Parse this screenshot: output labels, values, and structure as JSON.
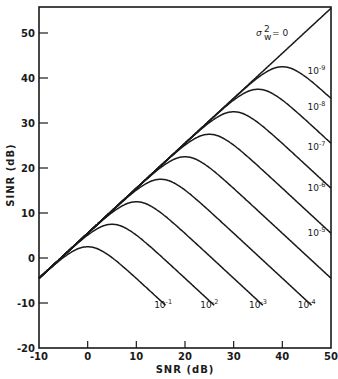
{
  "chart_data": {
    "type": "line",
    "title": "",
    "xlabel": "SNR (dB)",
    "ylabel": "SINR (dB)",
    "xlim": [
      -10,
      50
    ],
    "ylim": [
      -20,
      56
    ],
    "grid": false,
    "legend": "inline curve labels",
    "x_ticks": [
      -10,
      0,
      10,
      20,
      30,
      40,
      50
    ],
    "x_tick_labels": [
      "-10",
      "0",
      "10",
      "20",
      "30",
      "40",
      "50"
    ],
    "y_ticks": [
      -20,
      -10,
      0,
      10,
      20,
      30,
      40,
      50
    ],
    "y_tick_labels": [
      "-20",
      "-10",
      "0",
      "10",
      "20",
      "30",
      "40",
      "50"
    ],
    "x": [
      -10,
      -5,
      0,
      5,
      10,
      15,
      20,
      25,
      30,
      35,
      40,
      45,
      50
    ],
    "series": [
      {
        "name": "σw² = 0",
        "label": "σ",
        "values": [
          -4.5,
          0.5,
          5.5,
          10.5,
          15.5,
          20.5,
          25.5,
          30.5,
          35.5,
          40.5,
          45.5,
          50.5,
          55.5
        ]
      },
      {
        "name": "10^-1",
        "peak_snr": 0,
        "values": [
          -4.5,
          0.1,
          2.5,
          0.1,
          -4.5,
          -9.5,
          null,
          null,
          null,
          null,
          null,
          null,
          null
        ]
      },
      {
        "name": "10^-2",
        "peak_snr": 5,
        "values": [
          -4.5,
          0.5,
          5.1,
          7.5,
          5.1,
          0.5,
          -4.5,
          -9.5,
          null,
          null,
          null,
          null,
          null
        ]
      },
      {
        "name": "10^-3",
        "peak_snr": 10,
        "values": [
          -4.5,
          0.5,
          5.5,
          10.1,
          12.5,
          10.1,
          5.5,
          0.5,
          -4.5,
          -9.5,
          null,
          null,
          null
        ]
      },
      {
        "name": "10^-4",
        "peak_snr": 15,
        "values": [
          -4.5,
          0.5,
          5.5,
          10.5,
          15.1,
          17.5,
          15.1,
          10.5,
          5.5,
          0.5,
          -4.5,
          -9.5,
          null
        ]
      },
      {
        "name": "10^-5",
        "peak_snr": 20,
        "values": [
          -4.5,
          0.5,
          5.5,
          10.5,
          15.5,
          20.1,
          22.5,
          20.1,
          15.5,
          10.5,
          5.5,
          0.5,
          -4.5
        ]
      },
      {
        "name": "10^-6",
        "peak_snr": 25,
        "values": [
          -4.5,
          0.5,
          5.5,
          10.5,
          15.5,
          20.5,
          25.1,
          27.5,
          25.1,
          20.5,
          15.5,
          10.5,
          5.5
        ]
      },
      {
        "name": "10^-7",
        "peak_snr": 30,
        "values": [
          -4.5,
          0.5,
          5.5,
          10.5,
          15.5,
          20.5,
          25.5,
          30.1,
          32.5,
          30.1,
          25.5,
          20.5,
          15.5
        ]
      },
      {
        "name": "10^-8",
        "peak_snr": 35,
        "values": [
          -4.5,
          0.5,
          5.5,
          10.5,
          15.5,
          20.5,
          25.5,
          30.5,
          35.1,
          37.5,
          35.1,
          30.5,
          25.5
        ]
      },
      {
        "name": "10^-9",
        "peak_snr": 40,
        "values": [
          -4.5,
          0.5,
          5.5,
          10.5,
          15.5,
          20.5,
          25.5,
          30.5,
          35.5,
          40.1,
          42.5,
          40.1,
          35.5
        ]
      }
    ],
    "annotations": [
      {
        "text": "σw² = 0",
        "x": 37,
        "y": 50
      },
      {
        "text": "10^-9",
        "x": 47,
        "y": 41
      },
      {
        "text": "10^-8",
        "x": 47,
        "y": 33
      },
      {
        "text": "10^-7",
        "x": 47,
        "y": 24
      },
      {
        "text": "10^-6",
        "x": 47,
        "y": 15
      },
      {
        "text": "10^-5",
        "x": 47,
        "y": 5
      },
      {
        "text": "10^-4",
        "x": 45,
        "y": -11
      },
      {
        "text": "10^-3",
        "x": 35,
        "y": -11
      },
      {
        "text": "10^-2",
        "x": 25,
        "y": -11
      },
      {
        "text": "10^-1",
        "x": 15.5,
        "y": -11
      }
    ]
  },
  "labels": {
    "xlabel": "SNR (dB)",
    "ylabel": "SINR (dB)",
    "sigma_label": "σ",
    "sigma_sub": "w",
    "sigma_sup": "2",
    "sigma_eq": "= 0"
  }
}
